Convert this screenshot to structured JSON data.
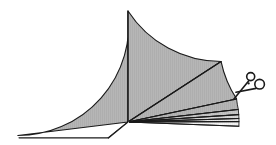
{
  "figure": {
    "title": "Sector divided into wedges with scissors",
    "background_color": "#ffffff",
    "outline_color": "#1a1a1a",
    "fill_color": "#b5b5b5",
    "hatch_color": "#a8a8a8"
  },
  "geometry": {
    "center_x": 128,
    "center_y": 122,
    "radius": 111,
    "baseline_y": 138,
    "left_edge_x": 19,
    "arc_top_y": 11,
    "arc_right_x": 226,
    "notes": "apex at center; flat clipped base on lower-left"
  },
  "chart_data": {
    "type": "pie",
    "title": "Sector divided into wedges with scissors",
    "center": [
      128,
      122
    ],
    "radius": 111,
    "angle_unit": "degrees",
    "angle_convention": "counterclockwise from positive x-axis",
    "clipped_baseline_y": 138,
    "wedges": [
      {
        "name": "large-left-wedge",
        "start_angle": 90,
        "end_angle": 187,
        "fill": "#b5b5b5",
        "label": "large left wedge"
      },
      {
        "name": "large-right-wedge",
        "start_angle": 33,
        "end_angle": 90,
        "fill": "#b5b5b5",
        "label": "large right wedge"
      },
      {
        "name": "medium-wedge",
        "start_angle": 12,
        "end_angle": 33,
        "fill": "#b5b5b5",
        "label": "medium wedge"
      },
      {
        "name": "thin-wedge-1",
        "start_angle": 6.5,
        "end_angle": 12,
        "fill": "#b5b5b5",
        "label": "thin wedge 1"
      },
      {
        "name": "thin-wedge-2",
        "start_angle": 3.8,
        "end_angle": 6.5,
        "fill": "#c6c6c6",
        "label": "thin wedge 2"
      },
      {
        "name": "thin-wedge-3",
        "start_angle": 1.8,
        "end_angle": 3.8,
        "fill": "#d8d8d8",
        "label": "thin wedge 3"
      },
      {
        "name": "thin-wedge-4",
        "start_angle": 0.2,
        "end_angle": 1.8,
        "fill": "#e8e8e8",
        "label": "thin wedge 4"
      },
      {
        "name": "thin-wedge-5",
        "start_angle": -2.2,
        "end_angle": 0.2,
        "fill": "#f2f2f2",
        "label": "thin wedge 5"
      }
    ],
    "divider_rays": [
      90,
      33,
      12,
      6.5,
      3.8,
      1.8,
      0.2,
      -2.2
    ],
    "xlabel": "",
    "ylabel": "",
    "grid": false,
    "legend": false
  },
  "scissors": {
    "label": "scissors",
    "icon": "scissors-icon",
    "position": [
      250,
      86
    ],
    "rotation_degrees": -28,
    "blade_color": "#1a1a1a",
    "handle_fill": "#ffffff",
    "ring_small_center": [
      250,
      77
    ],
    "ring_small_radius": 4.2,
    "ring_large_center": [
      259,
      84
    ],
    "ring_large_radius": 5.0,
    "blade_tip": [
      234,
      99
    ]
  },
  "annotations": []
}
